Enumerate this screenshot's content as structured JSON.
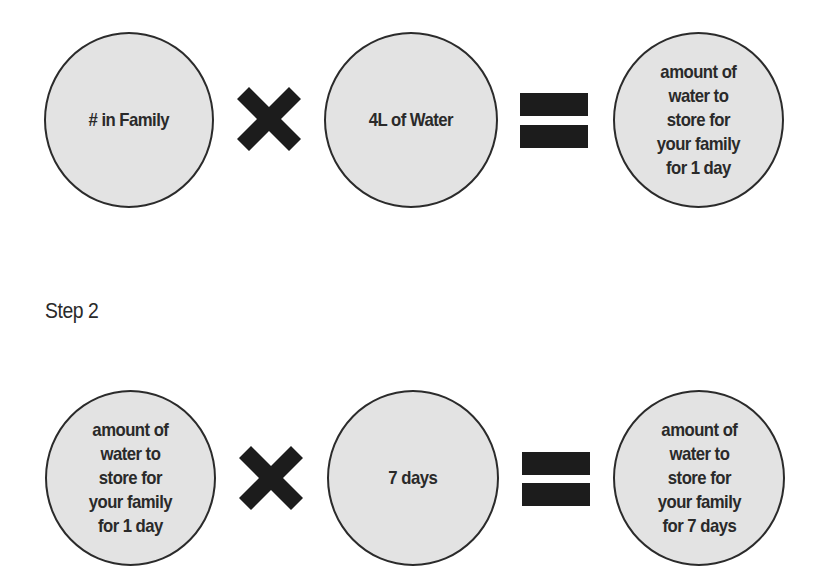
{
  "step1": {
    "operand1": "# in Family",
    "operator1": "multiply-icon",
    "operand2": "4L of Water",
    "operator2": "equals-icon",
    "result": "amount of\nwater to\nstore for\nyour family\nfor 1 day"
  },
  "step2": {
    "label": "Step 2",
    "operand1": "amount of\nwater to\nstore for\nyour family\nfor 1 day",
    "operator1": "multiply-icon",
    "operand2": "7 days",
    "operator2": "equals-icon",
    "result": "amount of\nwater to\nstore for\nyour family\nfor 7 days"
  },
  "colors": {
    "circle_fill": "#e3e3e3",
    "circle_border": "#2b2b2b",
    "operator": "#1c1c1c",
    "text": "#2a2a2a"
  }
}
